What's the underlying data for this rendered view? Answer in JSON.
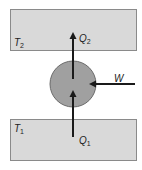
{
  "diagram": {
    "hot_reservoir": {
      "symbol": "T",
      "subscript": "2"
    },
    "cold_reservoir": {
      "symbol": "T",
      "subscript": "1"
    },
    "heat_out": {
      "symbol": "Q",
      "subscript": "2"
    },
    "heat_in": {
      "symbol": "Q",
      "subscript": "1"
    },
    "work": {
      "symbol": "W"
    },
    "colors": {
      "reservoir_fill": "#d9d9d9",
      "reservoir_stroke": "#8a8a8a",
      "engine_fill": "#a0a0a0",
      "engine_stroke": "#6a6a6a",
      "arrow": "#1a1a1a"
    }
  }
}
